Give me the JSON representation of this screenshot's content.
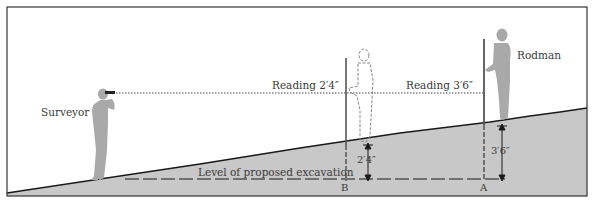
{
  "diagram": {
    "labels": {
      "surveyor": "Surveyor",
      "rodman": "Rodman",
      "reading_b": "Reading 2′4″",
      "reading_a": "Reading 3′6″",
      "excavation": "Level of proposed excavation",
      "point_b": "B",
      "point_a": "A",
      "depth_b": "2′4″",
      "depth_a": "3′6″"
    },
    "colors": {
      "ground_fill": "#c8c8c8",
      "figure_fill": "#a9a9a9",
      "line": "#1a1a1a",
      "frame": "#333333"
    }
  }
}
